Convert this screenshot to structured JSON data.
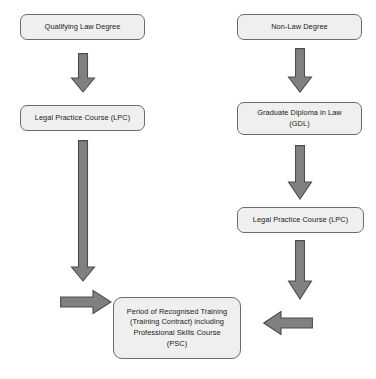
{
  "diagram": {
    "type": "flowchart",
    "background_color": "#ffffff",
    "node_fill_color": "#efefef",
    "node_border_color": "#6b6b6b",
    "arrow_fill_color": "#808080",
    "arrow_border_color": "#4d4d4d",
    "text_color": "#1a1a1a"
  },
  "nodes": {
    "qualifying_law_degree": {
      "lines": [
        "Qualifying Law Degree"
      ]
    },
    "non_law_degree": {
      "lines": [
        "Non-Law Degree"
      ]
    },
    "lpc_left": {
      "lines": [
        "Legal Practice Course (LPC)"
      ]
    },
    "gdl": {
      "lines": [
        "Graduate Diploma in Law",
        "(GDL)"
      ]
    },
    "lpc_right": {
      "lines": [
        "Legal Practice Course (LPC)"
      ]
    },
    "training": {
      "lines": [
        "Period of Recognised Training",
        "(Training Contract) including",
        "Professional Skills Course",
        "(PSC)"
      ]
    }
  },
  "arrows": [
    {
      "name": "arrow-qld-to-lpc",
      "direction": "down"
    },
    {
      "name": "arrow-nonlaw-to-gdl",
      "direction": "down"
    },
    {
      "name": "arrow-lpc-left-to-training",
      "direction": "down"
    },
    {
      "name": "arrow-gdl-to-lpc-right",
      "direction": "down"
    },
    {
      "name": "arrow-lpc-right-to-training",
      "direction": "down"
    },
    {
      "name": "arrow-left-into-training",
      "direction": "right"
    },
    {
      "name": "arrow-right-into-training",
      "direction": "left"
    }
  ]
}
